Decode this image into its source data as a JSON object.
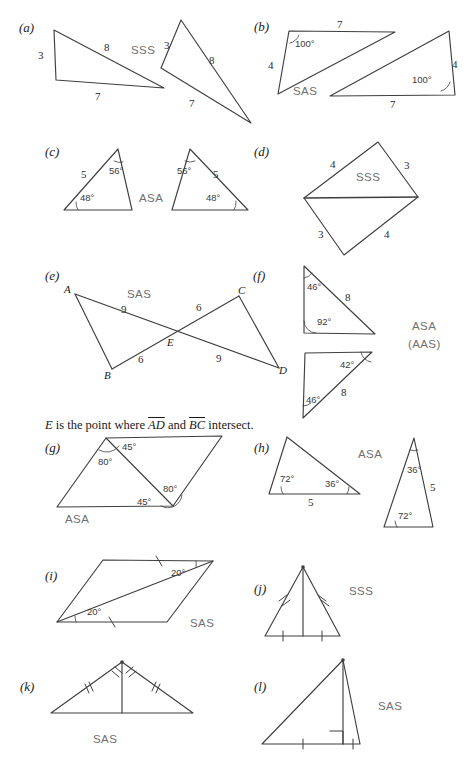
{
  "page": {
    "kind": "geometry-exercise-figure",
    "width": 466,
    "height": 774,
    "background": "#ffffff",
    "ink": "#3a3a3a",
    "criterion_color": "#6f6f6f"
  },
  "note": {
    "prefix": "E",
    "text_before": " is the point where ",
    "seg1": "AD",
    "mid": " and ",
    "seg2": "BC",
    "text_after": " intersect."
  },
  "parts": [
    {
      "id": "a",
      "label": "(a)",
      "criterion": "SSS",
      "side_labels": [
        "3",
        "8",
        "7",
        "3",
        "8",
        "7"
      ]
    },
    {
      "id": "b",
      "label": "(b)",
      "criterion": "SAS",
      "side_labels": [
        "7",
        "4",
        "4",
        "7"
      ],
      "angle_labels": [
        "100°",
        "100°"
      ]
    },
    {
      "id": "c",
      "label": "(c)",
      "criterion": "ASA",
      "side_labels": [
        "5",
        "5"
      ],
      "angle_labels": [
        "56°",
        "48°",
        "56°",
        "48°"
      ]
    },
    {
      "id": "d",
      "label": "(d)",
      "criterion": "SSS",
      "side_labels": [
        "4",
        "3",
        "3",
        "4"
      ]
    },
    {
      "id": "e",
      "label": "(e)",
      "criterion": "SAS",
      "side_labels": [
        "9",
        "6",
        "6",
        "9"
      ],
      "vertex_labels": [
        "A",
        "B",
        "C",
        "D",
        "E"
      ]
    },
    {
      "id": "f",
      "label": "(f)",
      "criterion": "ASA",
      "criterion2": "(AAS)",
      "side_labels": [
        "8",
        "8"
      ],
      "angle_labels": [
        "46°",
        "92°",
        "42°",
        "46°"
      ]
    },
    {
      "id": "g",
      "label": "(g)",
      "criterion": "ASA",
      "angle_labels": [
        "45°",
        "80°",
        "80°",
        "45°"
      ]
    },
    {
      "id": "h",
      "label": "(h)",
      "criterion": "ASA",
      "side_labels": [
        "5",
        "5"
      ],
      "angle_labels": [
        "72°",
        "36°",
        "36°",
        "72°"
      ]
    },
    {
      "id": "i",
      "label": "(i)",
      "criterion": "SAS",
      "angle_labels": [
        "20°",
        "20°"
      ]
    },
    {
      "id": "j",
      "label": "(j)",
      "criterion": "SSS"
    },
    {
      "id": "k",
      "label": "(k)",
      "criterion": "SAS"
    },
    {
      "id": "l",
      "label": "(l)",
      "criterion": "SAS"
    }
  ]
}
